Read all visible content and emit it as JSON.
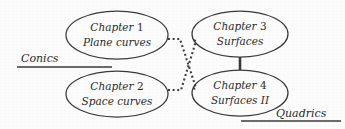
{
  "figure": {
    "type": "flow-diagram",
    "background_color": "#fcfcfc",
    "stroke_color": "#3a3a3a",
    "text_color": "#2b2b2b"
  },
  "nodes": [
    {
      "id": "chapter-1",
      "line1_prefix": "Chapter",
      "line1_number": "1",
      "line2": "Plane curves",
      "cx": 117,
      "cy": 35,
      "rx": 51,
      "ry": 24
    },
    {
      "id": "chapter-2",
      "line1_prefix": "Chapter",
      "line1_number": "2",
      "line2": "Space curves",
      "cx": 117,
      "cy": 94,
      "rx": 51,
      "ry": 23
    },
    {
      "id": "chapter-3",
      "line1_prefix": "Chapter",
      "line1_number": "3",
      "line2": "Surfaces",
      "cx": 240,
      "cy": 34,
      "rx": 48,
      "ry": 23
    },
    {
      "id": "chapter-4",
      "line1_prefix": "Chapter",
      "line1_number": "4",
      "line2": "Surfaces II",
      "cx": 240,
      "cy": 93,
      "rx": 48,
      "ry": 23
    }
  ],
  "connectors": {
    "dotted_crossing": [
      {
        "id": "edge-ch1-ch4",
        "from": "chapter-1",
        "to": "chapter-4",
        "style": "dotted",
        "points": "168,39 180,39 196,88 193,89"
      },
      {
        "id": "edge-ch2-ch3",
        "from": "chapter-2",
        "to": "chapter-3",
        "style": "dotted",
        "points": "168,90 181,90 196,41 193,40"
      }
    ],
    "solid_vertical": {
      "id": "edge-ch3-ch4",
      "from": "chapter-3",
      "to": "chapter-4",
      "style": "solid",
      "x": 240,
      "y1": 57,
      "y2": 70
    }
  },
  "group_labels": [
    {
      "id": "conics",
      "text": "Conics",
      "text_x": 21,
      "text_y": 62,
      "rule_x1": 17,
      "rule_x2": 112,
      "rule_y": 67
    },
    {
      "id": "quadrics",
      "text": "Quadrics",
      "text_x": 276,
      "text_y": 117,
      "rule_x1": 241,
      "rule_x2": 341,
      "rule_y": 121
    }
  ]
}
